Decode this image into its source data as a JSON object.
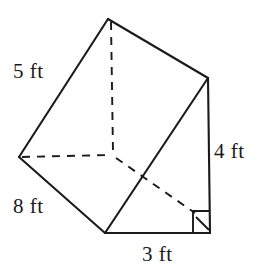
{
  "figure": {
    "name": "triangular-prism",
    "stroke_color": "#1a1a1a",
    "background_color": "#ffffff",
    "labels": {
      "slant_left": "5 ft",
      "length_bottom_left": "8 ft",
      "height_right": "4 ft",
      "base_bottom": "3 ft"
    },
    "vertices": {
      "apex_top": [
        108,
        19
      ],
      "left": [
        19,
        157
      ],
      "bottom_front": [
        105,
        233
      ],
      "top_right": [
        208,
        78
      ],
      "bottom_right": [
        210,
        233
      ],
      "back_hidden": [
        113,
        155
      ]
    },
    "right_angle_marker": {
      "corner": [
        210,
        233
      ],
      "size": 17
    }
  }
}
